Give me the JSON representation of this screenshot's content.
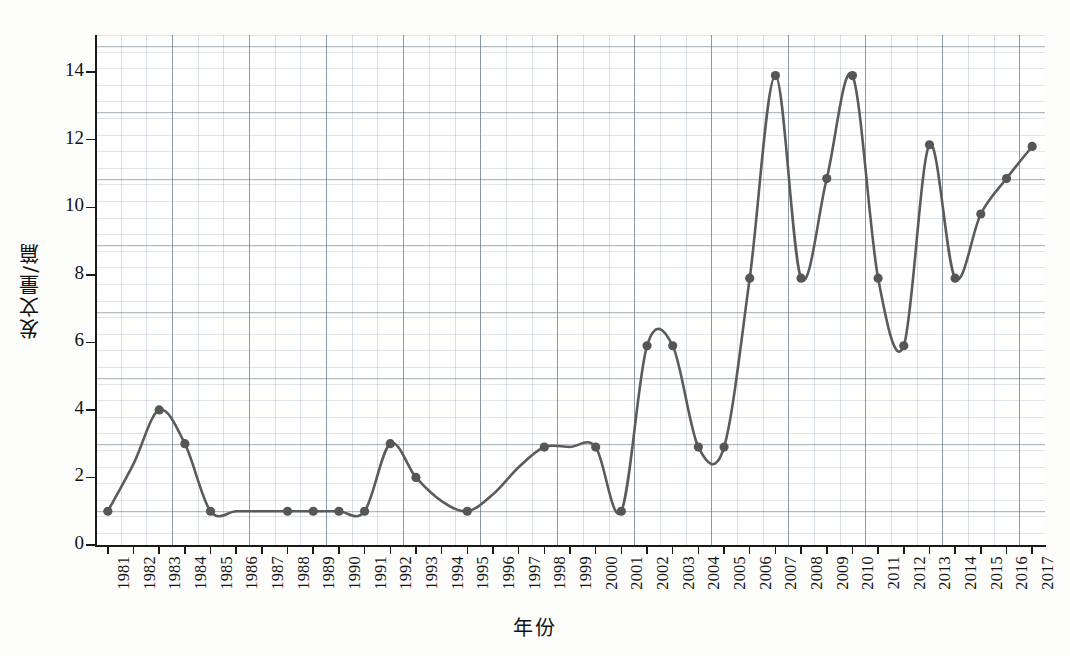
{
  "chart_data": {
    "type": "line",
    "title": "",
    "subtitle": "",
    "xlabel": "年份",
    "ylabel": "发文量/篇",
    "grid": true,
    "legend": "none",
    "xlim": [
      1980.5,
      2017.5
    ],
    "ylim": [
      0,
      15.1
    ],
    "yticks": [
      0,
      2,
      4,
      6,
      8,
      10,
      12,
      14
    ],
    "categories": [
      "1981",
      "1982",
      "1983",
      "1984",
      "1985",
      "1986",
      "1987",
      "1988",
      "1989",
      "1990",
      "1991",
      "1992",
      "1993",
      "1994",
      "1995",
      "1996",
      "1997",
      "1998",
      "1999",
      "2000",
      "2001",
      "2002",
      "2003",
      "2004",
      "2005",
      "2006",
      "2007",
      "2008",
      "2009",
      "2010",
      "2011",
      "2012",
      "2013",
      "2014",
      "2015",
      "2016",
      "2017"
    ],
    "values": [
      1,
      2.4,
      4,
      3,
      1,
      1,
      1,
      1,
      1,
      1,
      1,
      3,
      2,
      1.3,
      1,
      1.5,
      2.3,
      2.9,
      2.9,
      2.9,
      1,
      5.9,
      5.9,
      2.9,
      2.9,
      7.9,
      13.9,
      7.9,
      10.85,
      13.9,
      7.9,
      5.9,
      11.85,
      7.9,
      9.8,
      10.85,
      11.8
    ],
    "marker_years": [
      "1981",
      "1983",
      "1984",
      "1985",
      "1988",
      "1989",
      "1990",
      "1991",
      "1992",
      "1993",
      "1995",
      "1998",
      "2000",
      "2001",
      "2002",
      "2003",
      "2004",
      "2005",
      "2006",
      "2007",
      "2008",
      "2009",
      "2010",
      "2011",
      "2012",
      "2013",
      "2014",
      "2015",
      "2016",
      "2017"
    ],
    "series_name": "发文量",
    "line_color": "#5b5b5b",
    "marker_color": "#565656",
    "grid_color": "#93a6b8",
    "axis_color": "#1a1a1a"
  }
}
